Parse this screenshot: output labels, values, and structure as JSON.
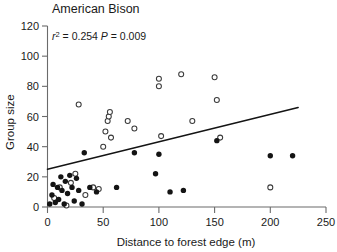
{
  "chart_data": {
    "type": "scatter",
    "title": "American Bison",
    "xlabel": "Distance to forest edge (m)",
    "ylabel": "Group size",
    "xlim": [
      0,
      250
    ],
    "ylim": [
      0,
      120
    ],
    "xticks": [
      0,
      50,
      100,
      150,
      200,
      250
    ],
    "yticks": [
      0,
      20,
      40,
      60,
      80,
      100,
      120
    ],
    "grid": false,
    "legend": "none",
    "annotations": {
      "r_squared_label": "r",
      "r_squared_exponent": "2",
      "r_squared_value": "= 0.254",
      "p_label": "P",
      "p_value": "= 0.009",
      "combined": "r2 = 0.254  P = 0.009"
    },
    "series": [
      {
        "name": "filled",
        "marker": "filled-circle",
        "color": "#141414",
        "points": [
          [
            2,
            2
          ],
          [
            4,
            8
          ],
          [
            5,
            15
          ],
          [
            7,
            3
          ],
          [
            9,
            13
          ],
          [
            10,
            5
          ],
          [
            12,
            20
          ],
          [
            13,
            11
          ],
          [
            15,
            2
          ],
          [
            16,
            17
          ],
          [
            18,
            9
          ],
          [
            20,
            21
          ],
          [
            22,
            13
          ],
          [
            24,
            4
          ],
          [
            26,
            19
          ],
          [
            28,
            11
          ],
          [
            31,
            2
          ],
          [
            33,
            36
          ],
          [
            38,
            13
          ],
          [
            44,
            10
          ],
          [
            62,
            13
          ],
          [
            78,
            36
          ],
          [
            97,
            22
          ],
          [
            100,
            35
          ],
          [
            110,
            10
          ],
          [
            122,
            11
          ],
          [
            152,
            44
          ],
          [
            200,
            34
          ],
          [
            220,
            34
          ]
        ]
      },
      {
        "name": "open",
        "marker": "open-circle",
        "color": "#ffffff",
        "points": [
          [
            6,
            6
          ],
          [
            11,
            13
          ],
          [
            17,
            1
          ],
          [
            21,
            16
          ],
          [
            25,
            22
          ],
          [
            28,
            68
          ],
          [
            34,
            8
          ],
          [
            41,
            13
          ],
          [
            46,
            12
          ],
          [
            50,
            40
          ],
          [
            52,
            50
          ],
          [
            54,
            57
          ],
          [
            55,
            60
          ],
          [
            56,
            63
          ],
          [
            57,
            46
          ],
          [
            72,
            57
          ],
          [
            78,
            52
          ],
          [
            100,
            80
          ],
          [
            100,
            85
          ],
          [
            102,
            47
          ],
          [
            120,
            88
          ],
          [
            130,
            57
          ],
          [
            150,
            86
          ],
          [
            152,
            71
          ],
          [
            155,
            46
          ],
          [
            200,
            13
          ]
        ]
      }
    ],
    "fit_line": {
      "name": "regression-line",
      "x_start": 0,
      "y_start": 25,
      "x_end": 225,
      "y_end": 66
    }
  }
}
